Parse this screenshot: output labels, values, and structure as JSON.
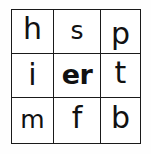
{
  "figure": {
    "kind": "letter-grid",
    "background_color": "#ffffff",
    "ink_color": "#111111",
    "border_color": "#1a1a1a",
    "rows": 3,
    "columns": 3
  },
  "grid": {
    "rows": [
      {
        "cells": [
          {
            "text": "h",
            "emphasis": "normal",
            "shape": "ascender"
          },
          {
            "text": "s",
            "emphasis": "normal",
            "shape": "x-height"
          },
          {
            "text": "p",
            "emphasis": "normal",
            "shape": "descender"
          }
        ]
      },
      {
        "cells": [
          {
            "text": "i",
            "emphasis": "normal",
            "shape": "dotted"
          },
          {
            "text": "er",
            "emphasis": "bold",
            "shape": "x-height"
          },
          {
            "text": "t",
            "emphasis": "normal",
            "shape": "ascender"
          }
        ]
      },
      {
        "cells": [
          {
            "text": "m",
            "emphasis": "normal",
            "shape": "x-height"
          },
          {
            "text": "f",
            "emphasis": "normal",
            "shape": "ascender"
          },
          {
            "text": "b",
            "emphasis": "normal",
            "shape": "ascender"
          }
        ]
      }
    ]
  }
}
